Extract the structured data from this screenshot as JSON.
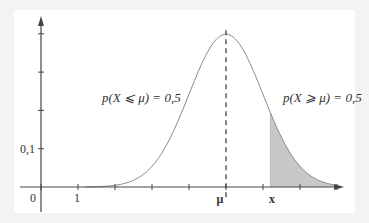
{
  "chart_data": {
    "type": "line",
    "title": "",
    "xlabel": "",
    "ylabel": "",
    "x_tick_labels": [
      {
        "label": "0",
        "value": 0
      },
      {
        "label": "1",
        "value": 1
      },
      {
        "label": "μ",
        "value": 5
      },
      {
        "label": "x",
        "value": 6.2
      }
    ],
    "y_tick_labels": [
      {
        "label": "0,1",
        "value": 0.1
      }
    ],
    "x_ticks": [
      0,
      1,
      2,
      3,
      4,
      5,
      6,
      7,
      8
    ],
    "y_ticks": [
      0.1,
      0.2,
      0.3,
      0.4
    ],
    "xlim": [
      -0.55,
      8.1
    ],
    "ylim": [
      -0.065,
      0.44
    ],
    "grid": false,
    "legend": null,
    "series": [
      {
        "name": "normal density",
        "mu": 5,
        "sigma": 1,
        "peak": 0.399,
        "x": [
          1.5,
          2,
          2.5,
          3,
          3.5,
          4,
          4.5,
          5,
          5.5,
          6,
          6.5,
          7,
          7.5,
          8
        ],
        "y": [
          0.001,
          0.004,
          0.018,
          0.054,
          0.13,
          0.242,
          0.352,
          0.399,
          0.352,
          0.242,
          0.13,
          0.054,
          0.018,
          0.004
        ]
      }
    ],
    "shaded_region": {
      "from": 6.2,
      "to": 8,
      "color": "#c8c8c8"
    },
    "mean_line": {
      "x": 5,
      "style": "dashed"
    },
    "annotations": [
      {
        "text": "p(X ⩽ μ) = 0,5",
        "position": "left of mean"
      },
      {
        "text": "p(X ⩾ μ) = 0,5",
        "position": "right of mean"
      }
    ]
  },
  "labels": {
    "left_prob": "p(X ⩽ μ) = 0,5",
    "right_prob": "p(X ⩾ μ) = 0,5",
    "origin": "0",
    "x_one": "1",
    "y_tick": "0,1",
    "mu": "μ",
    "x": "x"
  },
  "colors": {
    "background": "#f3f3f3",
    "plot_bg": "#ffffff",
    "axis": "#444444",
    "curve": "#888888",
    "shade": "#c8c8c8"
  }
}
